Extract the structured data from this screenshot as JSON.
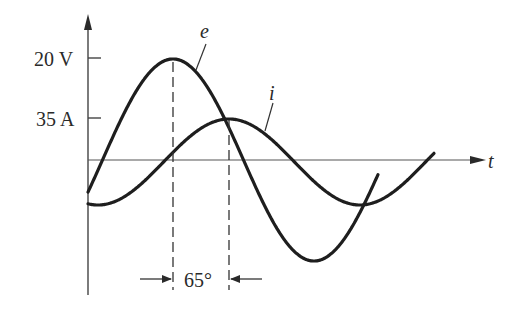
{
  "diagram": {
    "y_labels": {
      "voltage_peak": "20 V",
      "current_peak": "35 A"
    },
    "curve_labels": {
      "voltage": "e",
      "current": "i"
    },
    "x_axis_label": "t",
    "phase_label": "65°",
    "colors": {
      "ink": "#1e1e1e",
      "axis": "#555555"
    }
  },
  "chart_data": {
    "type": "line",
    "title": "",
    "xlabel": "t",
    "ylabel": "",
    "series": [
      {
        "name": "e",
        "peak": "20 V",
        "description": "voltage sinusoid, leads current"
      },
      {
        "name": "i",
        "peak": "35 A",
        "description": "current sinusoid, lags voltage"
      }
    ],
    "annotations": [
      {
        "text": "65°",
        "meaning": "phase difference between peak of e and peak of i"
      }
    ]
  }
}
